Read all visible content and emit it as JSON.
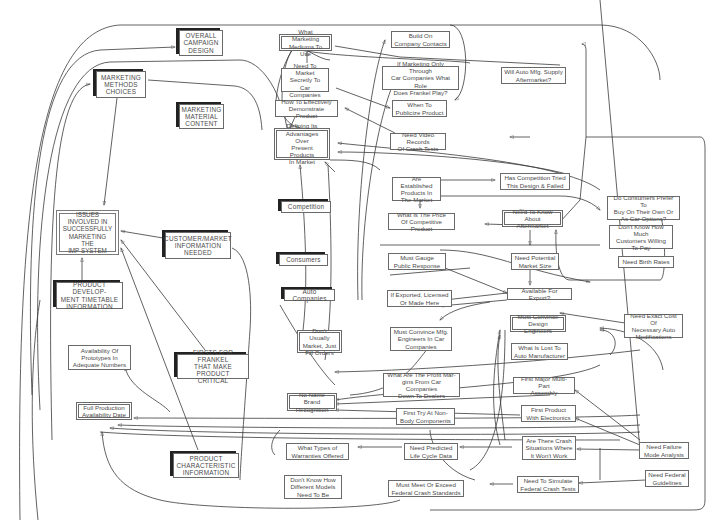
{
  "diagram": {
    "title": "Issues Involved in Successfully Marketing the IMP System",
    "nodes": [
      {
        "id": "overall-campaign-design",
        "label": "OVERALL\nCAMPAIGN\nDESIGN",
        "style": "heavy"
      },
      {
        "id": "marketing-methods-choices",
        "label": "MARKETING\nMETHODS\nCHOICES",
        "style": "heavy"
      },
      {
        "id": "marketing-material-content",
        "label": "MARKETING\nMATERIAL\nCONTENT",
        "style": "heavy"
      },
      {
        "id": "issues-central",
        "label": "ISSUES\nINVOLVED IN\nSUCCESSFULLY\nMARKETING THE\nIMP SYSTEM",
        "style": "center"
      },
      {
        "id": "customer-market-info",
        "label": "CUSTOMER/MARKET\nINFORMATION\nNEEDED",
        "style": "heavy"
      },
      {
        "id": "product-dev-timetable",
        "label": "PRODUCT DEVELOP-\nMENT TIMETABLE\nINFORMATION",
        "style": "heavy"
      },
      {
        "id": "availability-prototypes",
        "label": "Availability Of\nPrototypes In\nAdequate Numbers",
        "style": "plain"
      },
      {
        "id": "firsts-for-frankel",
        "label": "FIRSTS FOR FRANKEL\nTHAT MAKE PRODUCT\nCRITICAL",
        "style": "heavy"
      },
      {
        "id": "full-production-date",
        "label": "Full Production\nAvailability Date",
        "style": "double"
      },
      {
        "id": "product-characteristic",
        "label": "PRODUCT\nCHARACTERISTIC\nINFORMATION",
        "style": "heavy"
      },
      {
        "id": "what-marketing-mediums",
        "label": "What Marketing\nMediums To Use",
        "style": "double"
      },
      {
        "id": "need-market-secretly",
        "label": "Need To Market\nSecretly To\nCar Companies",
        "style": "plain"
      },
      {
        "id": "how-demonstrate",
        "label": "How To Effectively\nDemonstrate Product",
        "style": "plain"
      },
      {
        "id": "defining-advantages",
        "label": "Defining Its\nAdvantages Over\nPresent Products\nIn  Market",
        "style": "double"
      },
      {
        "id": "competition",
        "label": "Competition",
        "style": "heavy"
      },
      {
        "id": "consumers",
        "label": "Consumers",
        "style": "heavy"
      },
      {
        "id": "auto-companies",
        "label": "Auto Companies",
        "style": "heavy"
      },
      {
        "id": "dont-usually-market",
        "label": "Don't Usually\nMarket, Just\nFill Orders",
        "style": "double"
      },
      {
        "id": "no-name-brand",
        "label": "No Name Brand\nRecognition",
        "style": "double"
      },
      {
        "id": "what-types-warranties",
        "label": "What Types of\nWarranties Offered",
        "style": "plain"
      },
      {
        "id": "dont-know-models",
        "label": "Don't Know How\nDifferent Models\nNeed To Be",
        "style": "plain"
      },
      {
        "id": "build-on-contacts",
        "label": "Build On\nCompany Contacts",
        "style": "plain"
      },
      {
        "id": "if-marketing-only",
        "label": "If Marketing Only Through\nCar Companies What Role\nDoes Frankel Play?",
        "style": "plain"
      },
      {
        "id": "when-to-publicize",
        "label": "When To\nPublicize Product",
        "style": "plain"
      },
      {
        "id": "need-video-records",
        "label": "Need Video Records\nOf Crash Tests",
        "style": "plain"
      },
      {
        "id": "will-auto-mfg-supply",
        "label": "Will Auto Mfg. Supply\nAftermarket?",
        "style": "plain"
      },
      {
        "id": "are-established-products",
        "label": "Are Established\nProducts In\nThe Market",
        "style": "plain"
      },
      {
        "id": "has-competition-tried",
        "label": "Has Competition Tried\nThis Design & Failed",
        "style": "plain"
      },
      {
        "id": "price-competitive",
        "label": "What Is The Price\nOf Competitive Product",
        "style": "plain"
      },
      {
        "id": "need-know-aftermarket",
        "label": "Need To Know About\nAftermarket",
        "style": "double"
      },
      {
        "id": "consumers-prefer",
        "label": "Do Consumers Prefer To\nBuy On Their Own Or\nAs Car Options?",
        "style": "plain"
      },
      {
        "id": "dont-know-willing-pay",
        "label": "Don't Know How Much\nCustomers Willing\nTo Pay",
        "style": "plain"
      },
      {
        "id": "need-birth-rates",
        "label": "Need Birth Rates",
        "style": "plain"
      },
      {
        "id": "must-gauge-response",
        "label": "Must Gauge\nPublic Response",
        "style": "plain"
      },
      {
        "id": "need-market-size",
        "label": "Need Potential\nMarket Size",
        "style": "plain"
      },
      {
        "id": "available-for-export",
        "label": "Available For Export?",
        "style": "plain"
      },
      {
        "id": "if-exported",
        "label": "If Exported, Licensed\nOr Made Here",
        "style": "plain"
      },
      {
        "id": "must-convince-mfg",
        "label": "Must Convince Mfg.\nEngineers In Car\nCompanies",
        "style": "plain"
      },
      {
        "id": "must-convince-design",
        "label": "Must Convince\nDesign Engineers",
        "style": "double"
      },
      {
        "id": "need-exact-cost",
        "label": "Need Exact Cost Of\nNecessary Auto\nModifications",
        "style": "plain"
      },
      {
        "id": "what-is-lost",
        "label": "What Is Lost To\nAuto Manufacturer",
        "style": "plain"
      },
      {
        "id": "profit-margins",
        "label": "What Are The Profit Mar-\ngins From Car Companies\nDown To Dealers",
        "style": "plain"
      },
      {
        "id": "first-major-multipart",
        "label": "First Major Multi-Part\nAssembly",
        "style": "plain"
      },
      {
        "id": "first-try-nonbody",
        "label": "First Try At Non-\nBody Components",
        "style": "plain"
      },
      {
        "id": "first-product-electronics",
        "label": "First Product\nWith Electronics",
        "style": "plain"
      },
      {
        "id": "need-predicted-life",
        "label": "Need Predicted\nLife Cycle Data",
        "style": "plain"
      },
      {
        "id": "crash-situations",
        "label": "Are There Crash\nSituations Where\nIt Won't Work",
        "style": "plain"
      },
      {
        "id": "need-failure-mode",
        "label": "Need Failure\nMode Analysis",
        "style": "plain"
      },
      {
        "id": "need-federal-guidelines",
        "label": "Need Federal\nGuidelines",
        "style": "plain"
      },
      {
        "id": "must-meet-federal",
        "label": "Must Meet Or Exceed\nFederal Crash Standards",
        "style": "plain"
      },
      {
        "id": "need-simulate-federal",
        "label": "Need To Simulate\nFederal Crash Tests",
        "style": "plain"
      }
    ]
  }
}
